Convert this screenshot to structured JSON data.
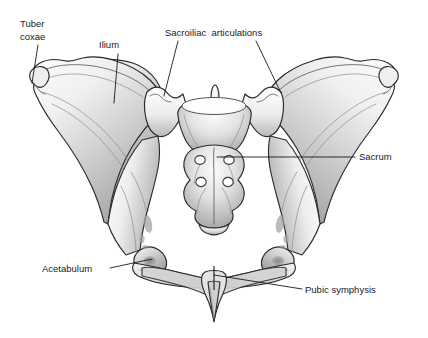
{
  "figure": {
    "width": 428,
    "height": 338,
    "background_color": "#ffffff",
    "line_color": "#1a1a1a",
    "bone_fill_light": "#f7f7f7",
    "bone_fill_mid": "#c9c9c9",
    "bone_fill_dark": "#8e8e8e",
    "style": "grayscale pen-and-ink shaded drawing"
  },
  "labels": {
    "tuber_coxae": {
      "line1": "Tuber",
      "line2": "coxae",
      "text_x": 20,
      "text_y": 27,
      "leader": "M38,45 L32,83"
    },
    "ilium": {
      "text": "Ilium",
      "text_x": 99,
      "text_y": 48,
      "leader": "M118,54 L114,103"
    },
    "sacroiliac": {
      "text": "Sacroiliac  articulations",
      "text_x": 165,
      "text_y": 36,
      "leader_left": "M178,41 L164,96",
      "leader_right": "M256,41 L281,93"
    },
    "sacrum": {
      "text": "Sacrum",
      "text_x": 359,
      "text_y": 160,
      "leader": "M355,157 L217,157"
    },
    "acetabulum": {
      "text": "Acetabulum",
      "text_x": 42,
      "text_y": 272,
      "leader": "M110,268 L152,259"
    },
    "pubic_symphysis": {
      "text": "Pubic symphysis",
      "text_x": 305,
      "text_y": 293,
      "leader": "M302,289 L214,275"
    }
  },
  "structures": [
    {
      "name": "left-ilium-wing",
      "label": "Left ilium wing"
    },
    {
      "name": "right-ilium-wing",
      "label": "Right ilium wing"
    },
    {
      "name": "sacrum-body",
      "label": "Sacrum"
    },
    {
      "name": "sacral-promontory",
      "label": "Sacral promontory"
    },
    {
      "name": "left-sacroiliac-joint",
      "label": "Left sacroiliac articulation"
    },
    {
      "name": "right-sacroiliac-joint",
      "label": "Right sacroiliac articulation"
    },
    {
      "name": "left-acetabulum",
      "label": "Left acetabulum"
    },
    {
      "name": "right-acetabulum",
      "label": "Right acetabulum"
    },
    {
      "name": "pubic-symphysis-joint",
      "label": "Pubic symphysis"
    },
    {
      "name": "left-tuber-coxae",
      "label": "Left tuber coxae"
    },
    {
      "name": "right-tuber-coxae",
      "label": "Right tuber coxae"
    },
    {
      "name": "sacral-foramina",
      "label": "Sacral foramina",
      "count": 4
    },
    {
      "name": "obturator-region",
      "label": "Obturator / pelvic inlet"
    }
  ]
}
